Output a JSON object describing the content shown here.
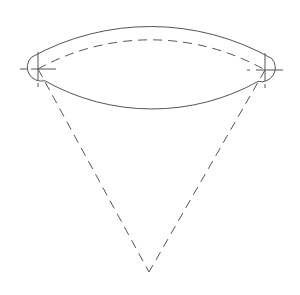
{
  "diagram": {
    "type": "curved-slot-sector",
    "colors": {
      "background": "#ffffff",
      "outline": "#555555",
      "dashed": "#555555"
    },
    "geometry": {
      "center": [
        149,
        272
      ],
      "radius": 232,
      "half_width": 14,
      "start_point": [
        38,
        69
      ],
      "end_point": [
        265,
        70
      ]
    }
  }
}
